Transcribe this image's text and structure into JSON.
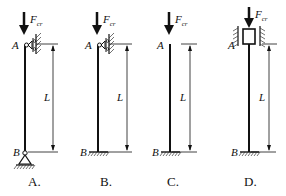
{
  "figure": {
    "columns": [
      {
        "id": "A",
        "caption": "A.",
        "top_label": "A",
        "bottom_label": "B",
        "length_label": "L",
        "force_label": "F",
        "force_subscript": "cr",
        "top_support": "roller-guide against wall (lateral restraint)",
        "bottom_support": "pinned (hinge)"
      },
      {
        "id": "B",
        "caption": "B.",
        "top_label": "A",
        "bottom_label": "B",
        "length_label": "L",
        "force_label": "F",
        "force_subscript": "cr",
        "top_support": "roller-guide against wall (lateral restraint)",
        "bottom_support": "fixed"
      },
      {
        "id": "C",
        "caption": "C.",
        "top_label": "A",
        "bottom_label": "B",
        "length_label": "L",
        "force_label": "F",
        "force_subscript": "cr",
        "top_support": "free",
        "bottom_support": "fixed"
      },
      {
        "id": "D",
        "caption": "D.",
        "top_label": "A",
        "bottom_label": "B",
        "length_label": "L",
        "force_label": "F",
        "force_subscript": "cr",
        "top_support": "sliding sleeve between walls (rotation fixed, vertical sliding)",
        "bottom_support": "fixed"
      }
    ],
    "colors": {
      "line": "#111111",
      "hatch": "#333333",
      "background": "#ffffff"
    }
  }
}
